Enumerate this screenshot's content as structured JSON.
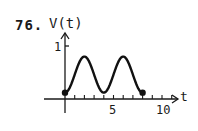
{
  "problem": {
    "number": "76."
  },
  "chart_data": {
    "type": "line",
    "title": "",
    "xlabel": "t",
    "ylabel": "V(t)",
    "x_ticks_labeled": [
      5,
      10
    ],
    "y_ticks_labeled": [
      1
    ],
    "xlim": [
      -1,
      10
    ],
    "ylim": [
      0,
      1
    ],
    "grid": false,
    "legend": null,
    "series": [
      {
        "name": "V(t)",
        "x": [
          0,
          1,
          2,
          3,
          4,
          5,
          6,
          7,
          8
        ],
        "y": [
          0.12,
          0.5,
          0.8,
          0.5,
          0.12,
          0.5,
          0.8,
          0.5,
          0.12
        ]
      }
    ],
    "endpoints": [
      {
        "t": 0,
        "v": 0.12,
        "marker": "filled-dot"
      },
      {
        "t": 8,
        "v": 0.12,
        "marker": "filled-dot"
      }
    ]
  },
  "labels": {
    "y_axis": "V(t)",
    "x_axis": "t",
    "y_tick_1": "1",
    "x_tick_5": "5",
    "x_tick_10": "10"
  }
}
